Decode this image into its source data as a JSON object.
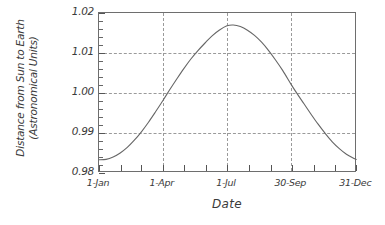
{
  "chart_data": {
    "type": "line",
    "title": "",
    "xlabel": "Date",
    "ylabel": "Distance from Sun to Earth (Astronomical Units)",
    "ylabel_line1": "Distance from Sun to Earth",
    "ylabel_line2": "(Astronomical Units)",
    "ylim": [
      0.98,
      1.02
    ],
    "xlim": [
      0,
      365
    ],
    "grid": true,
    "legend": "none",
    "line_color": "#666666",
    "frame_color": "#6e6e6e",
    "grid_color": "#9a9a9a",
    "y_ticks": [
      "0.98",
      "0.99",
      "1.00",
      "1.01",
      "1.02"
    ],
    "y_tick_values": [
      0.98,
      0.99,
      1.0,
      1.01,
      1.02
    ],
    "y_minor_step": 0.002,
    "y_gridlines": [
      0.99,
      1.0,
      1.01
    ],
    "x_ticks": [
      "1-Jan",
      "1-Apr",
      "1-Jul",
      "30-Sep",
      "31-Dec"
    ],
    "x_tick_days": [
      0,
      90,
      181,
      272,
      364
    ],
    "x_minor_tick_days": [
      0,
      31,
      59,
      90,
      120,
      151,
      181,
      212,
      243,
      273,
      304,
      334,
      364
    ],
    "x_gridline_days": [
      90,
      181,
      272
    ],
    "series": [
      {
        "name": "Earth-Sun distance",
        "x": [
          0,
          10,
          20,
          30,
          40,
          50,
          60,
          70,
          80,
          90,
          100,
          110,
          120,
          130,
          140,
          150,
          160,
          170,
          181,
          190,
          200,
          210,
          220,
          230,
          240,
          250,
          260,
          272,
          280,
          290,
          300,
          310,
          320,
          330,
          340,
          350,
          360,
          364
        ],
        "values": [
          0.9833,
          0.9834,
          0.984,
          0.985,
          0.9864,
          0.9882,
          0.9903,
          0.9927,
          0.9953,
          0.998,
          1.0008,
          1.0035,
          1.0061,
          1.0085,
          1.0106,
          1.0125,
          1.0143,
          1.0157,
          1.0168,
          1.017,
          1.0166,
          1.0157,
          1.0144,
          1.0127,
          1.0106,
          1.0082,
          1.0056,
          1.0021,
          0.9999,
          0.9973,
          0.9947,
          0.9922,
          0.9899,
          0.9878,
          0.9861,
          0.9847,
          0.9837,
          0.9834
        ]
      }
    ],
    "peak": {
      "value": 1.017,
      "at": "1-Jul"
    },
    "minimum": {
      "value": 0.983,
      "at": "1-Jan"
    }
  }
}
